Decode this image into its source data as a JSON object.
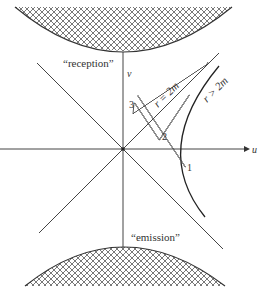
{
  "figure": {
    "axes": {
      "u_label": "u",
      "v_label": "v"
    },
    "regions": {
      "top_label": "“reception”",
      "bottom_label": "“emission”"
    },
    "lines": {
      "horizon_label": "r = 2m",
      "hyperbola_label": "r > 2m"
    },
    "points": [
      {
        "id": "1",
        "label": "1"
      },
      {
        "id": "2",
        "label": "2"
      },
      {
        "id": "3",
        "label": "3"
      }
    ],
    "colors": {
      "ink": "#333333",
      "hatch": "#555555",
      "background": "#ffffff"
    }
  }
}
